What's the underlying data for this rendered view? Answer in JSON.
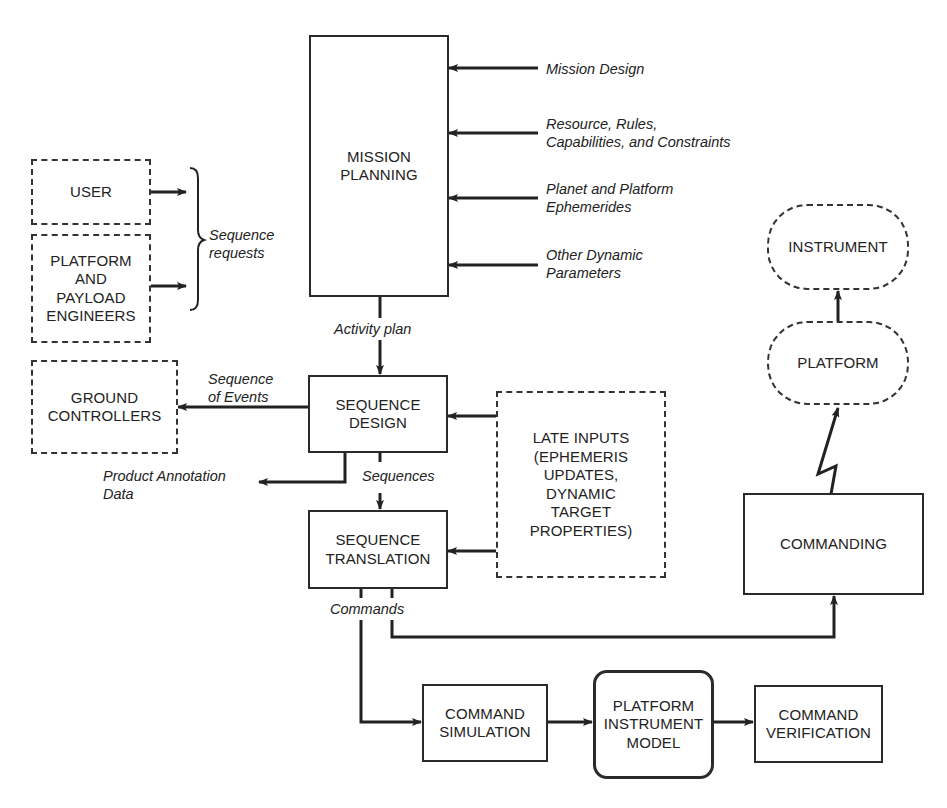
{
  "diagram": {
    "nodes": {
      "mission_planning": "MISSION\nPLANNING",
      "user": "USER",
      "platform_payload_engineers": "PLATFORM\nAND\nPAYLOAD\nENGINEERS",
      "ground_controllers": "GROUND\nCONTROLLERS",
      "sequence_design": "SEQUENCE\nDESIGN",
      "sequence_translation": "SEQUENCE\nTRANSLATION",
      "late_inputs": "LATE INPUTS\n(EPHEMERIS\nUPDATES,\nDYNAMIC\nTARGET\nPROPERTIES)",
      "instrument": "INSTRUMENT",
      "platform": "PLATFORM",
      "commanding": "COMMANDING",
      "command_simulation": "COMMAND\nSIMULATION",
      "platform_instrument_model": "PLATFORM\nINSTRUMENT\nMODEL",
      "command_verification": "COMMAND\nVERIFICATION"
    },
    "edge_labels": {
      "mission_design": "Mission Design",
      "resources_rules": "Resource, Rules,\nCapabilities, and Constraints",
      "ephemerides": "Planet and Platform\nEphemerides",
      "other_dynamic": "Other Dynamic\nParameters",
      "sequence_requests": "Sequence\nrequests",
      "activity_plan": "Activity plan",
      "sequence_of_events": "Sequence\nof Events",
      "product_annotation": "Product Annotation\nData",
      "sequences": "Sequences",
      "commands": "Commands"
    }
  }
}
